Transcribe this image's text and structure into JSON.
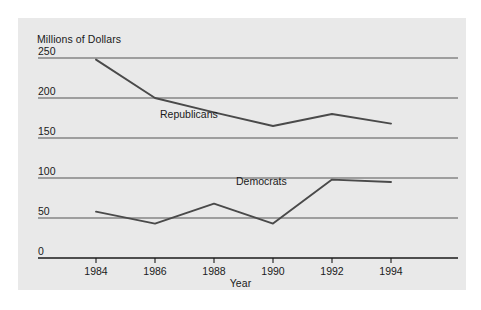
{
  "chart_data": {
    "type": "line",
    "title": "",
    "xlabel": "Year",
    "ylabel": "Millions of Dollars",
    "x": [
      1984,
      1986,
      1988,
      1990,
      1992,
      1994
    ],
    "xtick_labels": [
      "1984",
      "1986",
      "1988",
      "1990",
      "1992",
      "1994"
    ],
    "ytick_labels": [
      "250",
      "200",
      "150",
      "100",
      "50",
      "0"
    ],
    "ytick_values": [
      250,
      200,
      150,
      100,
      50,
      0
    ],
    "ylim": [
      0,
      250
    ],
    "xlim": [
      1983,
      1995.5
    ],
    "grid": "horizontal",
    "legend": "inline-labels",
    "series": [
      {
        "name": "Republicans",
        "values": [
          248,
          200,
          182,
          165,
          180,
          168
        ],
        "color": "#4a4a4a"
      },
      {
        "name": "Democrats",
        "values": [
          58,
          43,
          68,
          43,
          98,
          95
        ],
        "color": "#4a4a4a"
      }
    ]
  },
  "colors": {
    "panel_background": "#e9e9e9",
    "page_background": "#ffffff",
    "line": "#4a4a4a",
    "gridline": "#555555",
    "axis": "#1a1a1a",
    "text": "#1a1a1a"
  }
}
